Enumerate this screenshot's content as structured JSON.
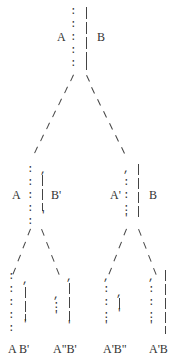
{
  "diagram": {
    "type": "tree",
    "root": {
      "left_label": "A",
      "right_label": "B"
    },
    "level1": [
      {
        "left_label": "A",
        "right_label": "B'"
      },
      {
        "left_label": "A'",
        "right_label": "B"
      }
    ],
    "leaves": [
      {
        "label": "A B'"
      },
      {
        "label": "A\"B'"
      },
      {
        "label": "A'B\""
      },
      {
        "label": "A'B"
      }
    ]
  },
  "colors": {
    "ink": "#333333",
    "background": "#ffffff"
  }
}
